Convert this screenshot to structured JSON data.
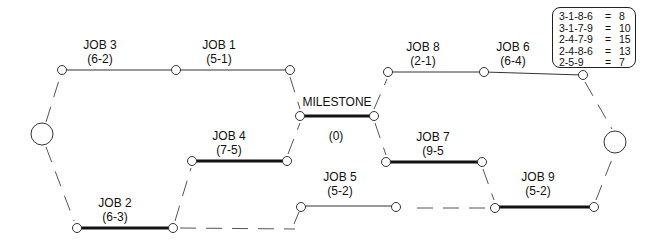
{
  "diagram": {
    "type": "pert-network",
    "jobs": [
      {
        "id": "job3",
        "name": "JOB 3",
        "times": "(6-2)",
        "critical": false
      },
      {
        "id": "job1",
        "name": "JOB 1",
        "times": "(5-1)",
        "critical": false
      },
      {
        "id": "job8",
        "name": "JOB 8",
        "times": "(2-1)",
        "critical": false
      },
      {
        "id": "job6",
        "name": "JOB 6",
        "times": "(6-4)",
        "critical": false
      },
      {
        "id": "milestone",
        "name": "MILESTONE",
        "times": "(0)",
        "critical": true
      },
      {
        "id": "job4",
        "name": "JOB 4",
        "times": "(7-5)",
        "critical": true
      },
      {
        "id": "job7",
        "name": "JOB 7",
        "times": "(9-5",
        "critical": true
      },
      {
        "id": "job2",
        "name": "JOB 2",
        "times": "(6-3)",
        "critical": true
      },
      {
        "id": "job5",
        "name": "JOB 5",
        "times": "(5-2)",
        "critical": false
      },
      {
        "id": "job9",
        "name": "JOB 9",
        "times": "(5-2)",
        "critical": true
      }
    ],
    "legend": [
      {
        "path": "3-1-8-6",
        "eq": "=",
        "value": "8"
      },
      {
        "path": "3-1-7-9",
        "eq": "=",
        "value": "10"
      },
      {
        "path": "2-4-7-9",
        "eq": "=",
        "value": "15"
      },
      {
        "path": "2-4-8-6",
        "eq": "=",
        "value": "13"
      },
      {
        "path": "2-5-9",
        "eq": "=",
        "value": "7"
      }
    ],
    "colors": {
      "line": "#111111",
      "dash": "#555555",
      "background": "#ffffff"
    }
  }
}
